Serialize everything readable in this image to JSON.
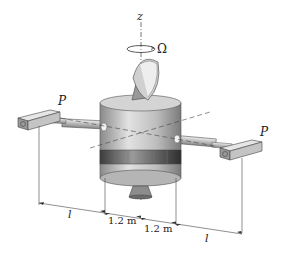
{
  "figure": {
    "axis_label": "z",
    "rotation_label": "Ω",
    "force_left": "P",
    "force_right": "P",
    "dimensions": [
      {
        "label": "l",
        "position": "left outer"
      },
      {
        "label": "1.2 m",
        "position": "left inner"
      },
      {
        "label": "1.2 m",
        "position": "right inner"
      },
      {
        "label": "l",
        "position": "right outer"
      }
    ]
  },
  "colors": {
    "body_light": "#d8d8d8",
    "body_mid": "#a8a8a8",
    "body_dark": "#5a5a5a",
    "line": "#333333"
  }
}
